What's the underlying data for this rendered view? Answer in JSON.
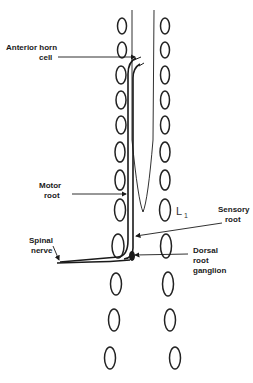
{
  "diagram": {
    "labels": {
      "anterior_horn_1": "Anterior horn",
      "anterior_horn_2": "cell",
      "motor_1": "Motor",
      "motor_2": "root",
      "sensory_1": "Sensory",
      "sensory_2": "root",
      "spinal_1": "Spinal",
      "spinal_2": "nerve",
      "dorsal_1": "Dorsal",
      "dorsal_2": "root",
      "dorsal_3": "ganglion",
      "segment": "L",
      "segment_sub": "1"
    },
    "colors": {
      "ink": "#1a1a1a",
      "background": "#ffffff"
    }
  }
}
